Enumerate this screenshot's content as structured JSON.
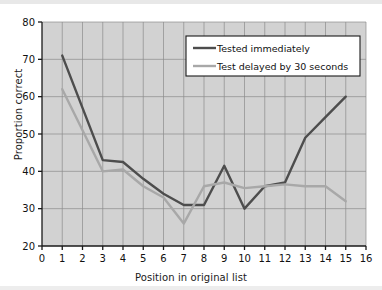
{
  "chart_data": {
    "type": "line",
    "title": "",
    "xlabel": "Position in original list",
    "ylabel": "Proportion correct",
    "xlim": [
      0,
      16
    ],
    "ylim": [
      20,
      80
    ],
    "xticks": [
      0,
      1,
      2,
      3,
      4,
      5,
      6,
      7,
      8,
      9,
      10,
      11,
      12,
      13,
      14,
      15,
      16
    ],
    "yticks": [
      20,
      30,
      40,
      50,
      60,
      70,
      80
    ],
    "grid": true,
    "legend_position": "top-right",
    "plot_background": "#d2d2d2",
    "x": [
      1,
      2,
      3,
      4,
      5,
      6,
      7,
      8,
      9,
      10,
      11,
      12,
      13,
      14,
      15
    ],
    "series": [
      {
        "name": "Tested immediately",
        "color": "#4d4d4d",
        "values": [
          71,
          57,
          43,
          42.5,
          38,
          34,
          31,
          31,
          41.5,
          30,
          36,
          37,
          49,
          54.5,
          60
        ]
      },
      {
        "name": "Test delayed by 30 seconds",
        "color": "#a8a8a8",
        "values": [
          62,
          51,
          40,
          40.5,
          36,
          33,
          26,
          36,
          37,
          35.5,
          36,
          36.5,
          36,
          36,
          32
        ]
      }
    ]
  },
  "axes": {
    "y_tick_labels": [
      "80",
      "70",
      "60",
      "50",
      "40",
      "30",
      "20"
    ],
    "x_tick_labels": [
      "0",
      "1",
      "2",
      "3",
      "4",
      "5",
      "6",
      "7",
      "8",
      "9",
      "10",
      "11",
      "12",
      "13",
      "14",
      "15",
      "16"
    ],
    "y_axis_title": "Proportion correct",
    "x_axis_title": "Position in original list"
  },
  "legend": {
    "entries": [
      {
        "label": "Tested immediately",
        "color": "#4d4d4d"
      },
      {
        "label": "Test delayed by 30 seconds",
        "color": "#a8a8a8"
      }
    ]
  }
}
